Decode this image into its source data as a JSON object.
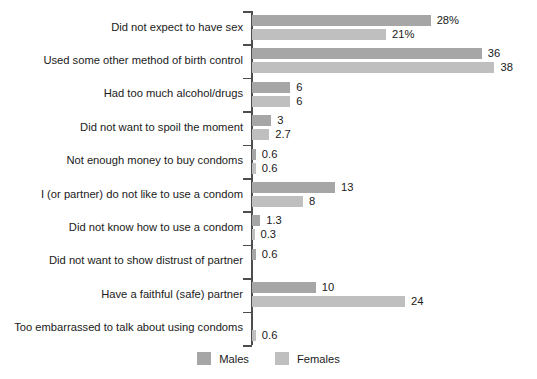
{
  "chart_data": {
    "type": "bar",
    "orientation": "horizontal",
    "title": "",
    "subtitle": "",
    "xlabel": "",
    "ylabel": "",
    "grid": false,
    "legend_position": "bottom-center",
    "xlim": [
      0,
      40
    ],
    "colors": {
      "males": "#a6a6a6",
      "females": "#bfbfbf",
      "axis": "#4d4d4d",
      "text": "#1a1a1a",
      "background": "#ffffff"
    },
    "categories": [
      "Did not expect to have sex",
      "Used some other method of birth control",
      "Had too much alcohol/drugs",
      "Did not want to spoil the moment",
      "Not enough money to buy condoms",
      "I (or partner) do not like to use a condom",
      "Did not know how to use a condom",
      "Did not want to show distrust of partner",
      "Have a faithful (safe) partner",
      "Too embarrassed to talk about using condoms"
    ],
    "series": [
      {
        "name": "Males",
        "color": "#a6a6a6",
        "values": [
          28,
          36,
          6,
          3,
          0.6,
          13,
          1.3,
          0.6,
          10,
          null
        ],
        "labels": [
          "28%",
          "36",
          "6",
          "3",
          "0.6",
          "13",
          "1.3",
          "0.6",
          "10",
          ""
        ]
      },
      {
        "name": "Females",
        "color": "#bfbfbf",
        "values": [
          21,
          38,
          6,
          2.7,
          0.6,
          8,
          0.3,
          null,
          24,
          0.6
        ],
        "labels": [
          "21%",
          "38",
          "6",
          "2.7",
          "0.6",
          "8",
          "0.3",
          "",
          "24",
          "0.6"
        ]
      }
    ],
    "legend": [
      {
        "label": "Males",
        "color": "#a6a6a6"
      },
      {
        "label": "Females",
        "color": "#bfbfbf"
      }
    ]
  }
}
